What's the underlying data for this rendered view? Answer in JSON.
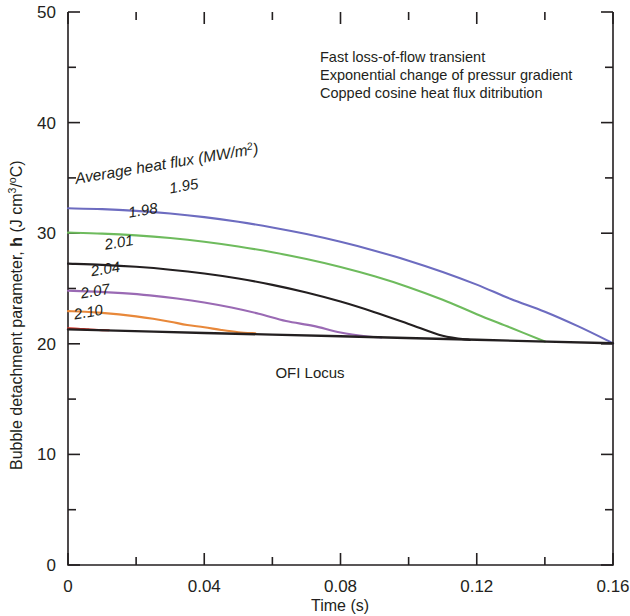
{
  "figure": {
    "name": "bubble-detachment-parameter-vs-time"
  },
  "axes": {
    "x": {
      "title": "Time (s)",
      "min": 0,
      "max": 0.16,
      "major_ticks": [
        0,
        0.04,
        0.08,
        0.12,
        0.16
      ],
      "tick_labels": [
        "0",
        "0.04",
        "0.08",
        "0.12",
        "0.16"
      ],
      "minor_tick_step": 0.02
    },
    "y": {
      "title_main": "Bubble detachment parameter, ",
      "title_symbol": "h",
      "title_units_pre": " (J cm",
      "title_units_sup": "3",
      "title_units_mid": "/",
      "title_units_deg": "o",
      "title_units_post": "C)",
      "title_plain": "Bubble detachment parameter, h (J cm3/oC)",
      "min": 0,
      "max": 50,
      "major_ticks": [
        0,
        10,
        20,
        30,
        40,
        50
      ],
      "tick_labels": [
        "0",
        "10",
        "20",
        "30",
        "40",
        "50"
      ],
      "minor_tick_step": 5
    }
  },
  "annotations": {
    "notes": [
      "Fast loss-of-flow transient",
      "Exponential change of pressur gradient",
      "Copped cosine heat flux ditribution"
    ],
    "series_heading": "Average heat flux (MW/m",
    "series_heading_sup": "2",
    "series_heading_tail": ")",
    "series_heading_plain": "Average heat flux (MW/m2)",
    "ofi_locus_label": "OFI Locus"
  },
  "chart_data": {
    "type": "line",
    "title": "",
    "xlabel": "Time (s)",
    "ylabel": "Bubble detachment parameter, h (J cm3/oC)",
    "xlim": [
      0,
      0.16
    ],
    "ylim": [
      0,
      50
    ],
    "grid": false,
    "legend": "inline-curve-labels",
    "series": [
      {
        "name": "1.95",
        "label": "1.95",
        "color": "#6d6cc0",
        "x": [
          0.0,
          0.01,
          0.02,
          0.03,
          0.04,
          0.05,
          0.06,
          0.07,
          0.08,
          0.09,
          0.1,
          0.11,
          0.12,
          0.13,
          0.14,
          0.15,
          0.16
        ],
        "y": [
          32.25,
          32.18,
          32.02,
          31.78,
          31.45,
          31.03,
          30.52,
          29.92,
          29.22,
          28.42,
          27.52,
          26.5,
          25.35,
          24.05,
          22.9,
          21.55,
          20.05
        ]
      },
      {
        "name": "1.98",
        "label": "1.98",
        "color": "#6ebb5d",
        "x": [
          0.0,
          0.01,
          0.02,
          0.03,
          0.04,
          0.05,
          0.06,
          0.07,
          0.08,
          0.09,
          0.1,
          0.11,
          0.12,
          0.13,
          0.14
        ],
        "y": [
          30.05,
          29.96,
          29.8,
          29.56,
          29.23,
          28.8,
          28.28,
          27.66,
          26.94,
          26.1,
          25.12,
          23.98,
          22.68,
          21.45,
          20.2
        ]
      },
      {
        "name": "2.01",
        "label": "2.01",
        "color": "#231f20",
        "x": [
          0.0,
          0.01,
          0.02,
          0.03,
          0.04,
          0.05,
          0.06,
          0.07,
          0.08,
          0.09,
          0.1,
          0.11,
          0.118
        ],
        "y": [
          27.25,
          27.14,
          26.96,
          26.7,
          26.35,
          25.9,
          25.33,
          24.64,
          23.82,
          22.86,
          21.8,
          20.72,
          20.35
        ]
      },
      {
        "name": "2.04",
        "label": "2.04",
        "color": "#9a6ab4",
        "x": [
          0.0,
          0.008,
          0.016,
          0.024,
          0.032,
          0.04,
          0.048,
          0.056,
          0.064,
          0.072,
          0.08,
          0.088,
          0.092
        ],
        "y": [
          24.8,
          24.72,
          24.58,
          24.38,
          24.1,
          23.74,
          23.28,
          22.72,
          22.06,
          21.62,
          21.02,
          20.66,
          20.58
        ]
      },
      {
        "name": "2.07",
        "label": "2.07",
        "color": "#e8883a",
        "x": [
          0.0,
          0.005,
          0.01,
          0.015,
          0.02,
          0.025,
          0.03,
          0.035,
          0.04,
          0.045,
          0.05,
          0.055
        ],
        "y": [
          22.95,
          22.9,
          22.8,
          22.66,
          22.48,
          22.26,
          22.0,
          21.7,
          21.5,
          21.25,
          21.05,
          20.95
        ]
      },
      {
        "name": "2.10",
        "label": "2.10",
        "color": "#d8362a",
        "x": [
          0.0,
          0.003,
          0.006,
          0.009,
          0.012
        ],
        "y": [
          21.4,
          21.36,
          21.3,
          21.25,
          21.22
        ]
      },
      {
        "name": "OFI Locus",
        "label": "OFI Locus",
        "color": "#231f20",
        "is_locus": true,
        "x": [
          0.0,
          0.04,
          0.08,
          0.12,
          0.16
        ],
        "y": [
          21.3,
          20.98,
          20.68,
          20.36,
          20.05
        ]
      }
    ],
    "curve_label_positions": [
      {
        "label": "1.95",
        "x": 0.03,
        "y": 33.6
      },
      {
        "label": "1.98",
        "x": 0.018,
        "y": 31.4
      },
      {
        "label": "2.01",
        "x": 0.011,
        "y": 28.5
      },
      {
        "label": "2.04",
        "x": 0.007,
        "y": 26.1
      },
      {
        "label": "2.07",
        "x": 0.004,
        "y": 24.1
      },
      {
        "label": "2.10",
        "x": 0.002,
        "y": 22.2
      }
    ]
  },
  "colors": {
    "axis": "#231f20",
    "background": "#ffffff",
    "blue": "#6d6cc0",
    "green": "#6ebb5d",
    "black": "#231f20",
    "purple": "#9a6ab4",
    "orange": "#e8883a",
    "red": "#d8362a"
  }
}
